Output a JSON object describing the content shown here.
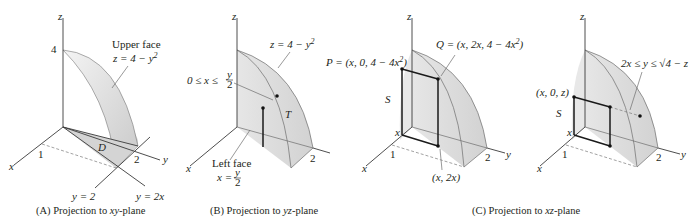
{
  "figure": {
    "panels": [
      {
        "id": "A",
        "caption": "(A) Projection to xy-plane",
        "caption_prefix": "(A) Projection to ",
        "caption_var": "xy",
        "caption_suffix": "-plane",
        "axis_labels": {
          "x": "x",
          "y": "y",
          "z": "z"
        },
        "ticks": {
          "z": "4",
          "x": "1",
          "y": "2"
        },
        "annotations": {
          "upper_face_title": "Upper face",
          "upper_face_eq": "z = 4 − y",
          "upper_face_exp": "2",
          "region": "D",
          "line1": "y = 2",
          "line2": "y = 2x"
        }
      },
      {
        "id": "B",
        "caption": "(B) Projection to yz-plane",
        "caption_prefix": "(B) Projection to ",
        "caption_var": "yz",
        "caption_suffix": "-plane",
        "axis_labels": {
          "x": "x",
          "z": "z"
        },
        "ticks": {
          "y": "2"
        },
        "annotations": {
          "surface_eq": "z = 4 − y",
          "surface_exp": "2",
          "range_left": "0 ≤ x ≤",
          "range_frac_num": "y",
          "range_frac_den": "2",
          "region": "T",
          "left_face_title": "Left face",
          "left_face_eq": "x =",
          "left_face_frac_num": "y",
          "left_face_frac_den": "2"
        }
      },
      {
        "id": "C1",
        "axis_labels": {
          "x": "x",
          "y": "y",
          "z": "z"
        },
        "ticks": {
          "x": "1",
          "y": "2",
          "x_small": "x"
        },
        "annotations": {
          "P": "P = (x, 0, 4 − 4x",
          "P_exp": "2",
          "Q": "Q = (x, 2x, 4 − 4x",
          "Q_exp": "2",
          "region": "S",
          "base_point": "(x, 2x)"
        }
      },
      {
        "id": "C2",
        "axis_labels": {
          "x": "x",
          "y": "y",
          "z": "z"
        },
        "ticks": {
          "x": "1",
          "y": "2",
          "x_small": "x"
        },
        "annotations": {
          "point": "(x, 0, z)",
          "region": "S",
          "range": "2x ≤ y ≤ √4 − z"
        }
      }
    ],
    "caption_C": {
      "prefix": "(C) Projection to ",
      "var": "xz",
      "suffix": "-plane"
    }
  }
}
